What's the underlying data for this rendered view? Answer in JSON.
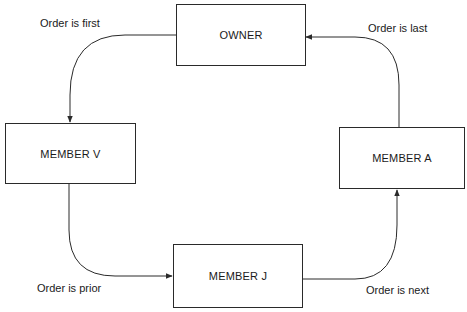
{
  "diagram": {
    "nodes": [
      {
        "id": "owner",
        "label": "OWNER"
      },
      {
        "id": "member_v",
        "label": "MEMBER V"
      },
      {
        "id": "member_a",
        "label": "MEMBER A"
      },
      {
        "id": "member_j",
        "label": "MEMBER J"
      }
    ],
    "edges": [
      {
        "from": "owner",
        "to": "member_v",
        "label": "Order is first"
      },
      {
        "from": "member_v",
        "to": "member_j",
        "label": "Order is prior"
      },
      {
        "from": "member_j",
        "to": "member_a",
        "label": "Order is next"
      },
      {
        "from": "member_a",
        "to": "owner",
        "label": "Order is last"
      }
    ]
  },
  "colors": {
    "line": "#2a2a2a",
    "background": "#ffffff",
    "text": "#1a1a1a"
  }
}
